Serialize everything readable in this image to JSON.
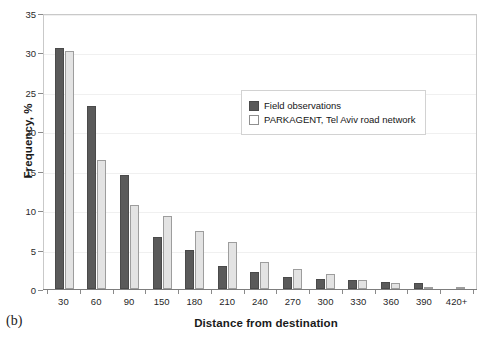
{
  "panel": {
    "label": "(b)"
  },
  "chart_data": {
    "type": "bar",
    "title": "",
    "xlabel": "Distance from destination",
    "ylabel": "Frequency, %",
    "categories": [
      "30",
      "60",
      "90",
      "150",
      "180",
      "210",
      "240",
      "270",
      "300",
      "330",
      "360",
      "390",
      "420+"
    ],
    "series": [
      {
        "name": "Field observations",
        "color": "#5a5a5a",
        "values": [
          30.6,
          23.2,
          14.5,
          6.6,
          5.0,
          2.9,
          2.1,
          1.5,
          1.3,
          1.1,
          0.9,
          0.8,
          0.0
        ]
      },
      {
        "name": "PARKAGENT, Tel Aviv road network",
        "color": "#e3e3e3",
        "values": [
          30.2,
          16.4,
          10.7,
          9.2,
          7.4,
          6.0,
          3.4,
          2.6,
          1.9,
          1.2,
          0.7,
          0.2,
          0.2
        ]
      }
    ],
    "ylim": [
      0,
      35
    ],
    "yticks": [
      0,
      5,
      10,
      15,
      20,
      25,
      30,
      35
    ],
    "grid": true,
    "legend_position": "upper-center"
  },
  "legend": {
    "entries": [
      {
        "label": "Field observations",
        "marker": "filled-square"
      },
      {
        "label": "PARKAGENT, Tel Aviv road network",
        "marker": "empty-square"
      }
    ]
  }
}
